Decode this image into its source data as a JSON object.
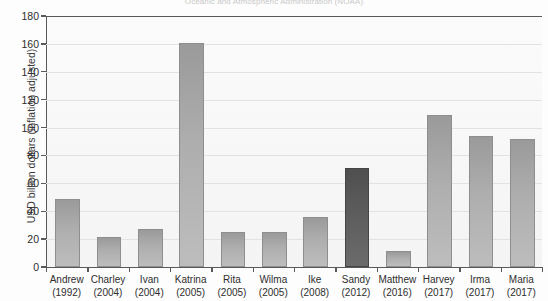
{
  "chart_data": {
    "type": "bar",
    "title": "Oceanic and Atmospheric Administration (NOAA)",
    "xlabel": "",
    "ylabel": "USD billion dollars (inflation adjusted)",
    "ylim": [
      0,
      180
    ],
    "yticks": [
      0,
      20,
      40,
      60,
      80,
      100,
      120,
      140,
      160,
      180
    ],
    "grid": true,
    "legend": "none",
    "categories": [
      "Andrew (1992)",
      "Charley (2004)",
      "Ivan (2004)",
      "Katrina (2005)",
      "Rita (2005)",
      "Wilma (2005)",
      "Ike (2008)",
      "Sandy (2012)",
      "Matthew (2016)",
      "Harvey (2017)",
      "Irma (2017)",
      "Maria (2017)"
    ],
    "names": [
      "Andrew",
      "Charley",
      "Ivan",
      "Katrina",
      "Rita",
      "Wilma",
      "Ike",
      "Sandy",
      "Matthew",
      "Harvey",
      "Irma",
      "Maria"
    ],
    "years": [
      "(1992)",
      "(2004)",
      "(2004)",
      "(2005)",
      "(2005)",
      "(2005)",
      "(2008)",
      "(2012)",
      "(2016)",
      "(2017)",
      "(2017)",
      "(2017)"
    ],
    "values": [
      49,
      21.5,
      27,
      161,
      25,
      25,
      36,
      71,
      11.5,
      109,
      94,
      92
    ],
    "highlighted": [
      "Sandy"
    ],
    "colors": {
      "bar": "#aeaeae",
      "bar_highlight": "#5a5a5a",
      "bar_border": "#8e8e8e",
      "axis": "#595959",
      "gridline": "#e2e2e2",
      "plot_background": "#f7f7f7",
      "text": "#2e2e2e",
      "title_text": "#c9c9c9"
    }
  }
}
